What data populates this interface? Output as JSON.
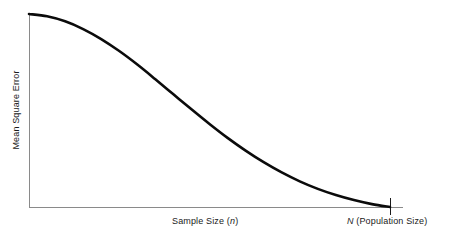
{
  "chart_data": {
    "type": "line",
    "title": "",
    "subtitle": "",
    "xlabel": "Sample Size (n)",
    "ylabel": "Mean Square Error",
    "grid": false,
    "legend": false,
    "legend_position": "none",
    "annotations": [
      {
        "id": "population-size-tick",
        "text": "N (Population Size)",
        "symbol": "N",
        "suffix": " (Population Size)",
        "x_value": 1.0,
        "note": "tick mark on x-axis at right end marking the full population size"
      }
    ],
    "axes": {
      "x": {
        "label": "Sample Size (n)",
        "symbol": "n",
        "ticks": [
          "N"
        ],
        "tick_positions": [
          1.0
        ],
        "xlim": [
          0,
          1.0
        ],
        "show_tick_values": false
      },
      "y": {
        "label": "Mean Square Error",
        "ticks": [],
        "ylim": [
          0,
          1.0
        ],
        "show_tick_values": false
      }
    },
    "series": [
      {
        "name": "Mean Square Error",
        "color": "#0b0b0b",
        "x": [
          0.0,
          0.05,
          0.1,
          0.15,
          0.2,
          0.25,
          0.3,
          0.35,
          0.4,
          0.45,
          0.5,
          0.55,
          0.6,
          0.65,
          0.7,
          0.75,
          0.8,
          0.85,
          0.9,
          0.95,
          1.0
        ],
        "values": [
          1.0,
          0.988,
          0.962,
          0.922,
          0.87,
          0.808,
          0.738,
          0.662,
          0.584,
          0.506,
          0.43,
          0.358,
          0.292,
          0.232,
          0.179,
          0.133,
          0.094,
          0.062,
          0.036,
          0.015,
          0.0
        ]
      }
    ]
  },
  "labels": {
    "x_axis_sample": {
      "prefix": "Sample Size (",
      "symbol": "n",
      "suffix": ")"
    },
    "x_axis_population": {
      "symbol": "N",
      "suffix": " (Population Size)"
    },
    "y_axis": "Mean Square Error"
  },
  "colors": {
    "curve": "#0b0b0b",
    "axis": "#8a8a8a",
    "tick": "#1a1a1a",
    "background": "#ffffff",
    "text": "#1a1a1a"
  }
}
